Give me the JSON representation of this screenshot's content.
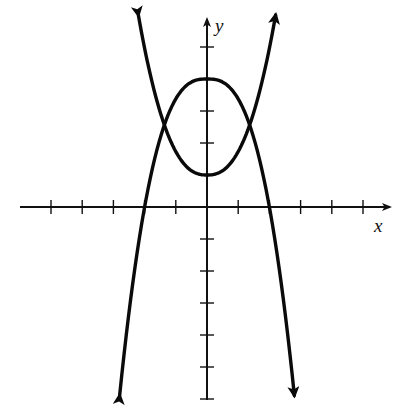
{
  "chart_data": {
    "type": "line",
    "title": "",
    "xlabel": "x",
    "ylabel": "y",
    "xlim": [
      -6,
      6
    ],
    "ylim": [
      -6,
      6
    ],
    "grid": false,
    "legend": null,
    "tick_spacing": 1,
    "x_ticks": [
      -5,
      -4,
      -3,
      -2,
      -1,
      1,
      2,
      3,
      4,
      5
    ],
    "y_ticks": [
      -6,
      -5,
      -4,
      -3,
      -2,
      -1,
      1,
      2,
      3,
      4,
      5
    ],
    "tick_labels_shown": false,
    "series": [
      {
        "name": "downward parabola",
        "description": "opens downward, vertex (0, 4), x-intercepts at -2 and 2, arrows at both ends pointing down",
        "vertex": [
          0,
          4
        ],
        "x_intercepts": [
          -2,
          2
        ],
        "points": [
          [
            -2.8,
            -5.9
          ],
          [
            -2.4,
            -2.5
          ],
          [
            -2,
            0
          ],
          [
            -1.38,
            2.55
          ],
          [
            -1,
            3.38
          ],
          [
            -0.5,
            3.9
          ],
          [
            0,
            4
          ],
          [
            0.5,
            3.9
          ],
          [
            1,
            3.38
          ],
          [
            1.38,
            2.55
          ],
          [
            2,
            0
          ],
          [
            2.4,
            -2.5
          ],
          [
            2.8,
            -5.9
          ]
        ]
      },
      {
        "name": "upward parabola",
        "description": "opens upward, vertex (0, 1), arrows at both ends pointing up",
        "vertex": [
          0,
          1
        ],
        "points": [
          [
            -2.2,
            6.0
          ],
          [
            -1.8,
            3.9
          ],
          [
            -1.38,
            2.55
          ],
          [
            -1,
            1.73
          ],
          [
            -0.5,
            1.13
          ],
          [
            0,
            1
          ],
          [
            0.5,
            1.13
          ],
          [
            1,
            1.73
          ],
          [
            1.38,
            2.55
          ],
          [
            1.8,
            3.9
          ],
          [
            2.2,
            6.0
          ]
        ]
      }
    ],
    "intersections": [
      [
        -1.38,
        2.55
      ],
      [
        1.38,
        2.55
      ]
    ]
  },
  "labels": {
    "x_axis": "x",
    "y_axis": "y"
  }
}
